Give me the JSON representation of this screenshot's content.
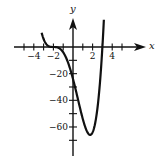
{
  "chart_data": {
    "type": "line",
    "title": "",
    "xlabel": "x",
    "ylabel": "y",
    "function_estimate": "y = (x + 2)^3 (x - 3)",
    "xlim": [
      -5.5,
      5.5
    ],
    "ylim": [
      -78,
      30
    ],
    "x_ticks": [
      -5,
      -4,
      -3,
      -2,
      -1,
      1,
      2,
      3,
      4,
      5
    ],
    "x_tick_labels": [
      "-4",
      "-2",
      "2",
      "4"
    ],
    "x_tick_label_values": [
      -4,
      -2,
      2,
      4
    ],
    "y_ticks": [
      -10,
      -20,
      -30,
      -40,
      -50,
      -60,
      -70
    ],
    "y_tick_labels": [
      "-20",
      "-40",
      "-60"
    ],
    "y_tick_label_values": [
      -20,
      -40,
      -60
    ],
    "grid": false,
    "legend": null,
    "series": [
      {
        "name": "f(x)",
        "x": [
          -3.2,
          -3.0,
          -2.5,
          -2.0,
          -1.5,
          -1.0,
          -0.5,
          0.0,
          0.5,
          1.0,
          1.5,
          1.75,
          2.0,
          2.5,
          3.0,
          3.15
        ],
        "y": [
          10.7,
          6.0,
          0.7,
          0.0,
          -0.6,
          -4.0,
          -12.2,
          -24.0,
          -39.1,
          -54.0,
          -64.3,
          -65.9,
          -64.0,
          -45.6,
          0.0,
          20.5
        ]
      }
    ],
    "key_points": {
      "x_intercepts": [
        -2,
        3
      ],
      "y_intercept": -24,
      "local_minimum": {
        "x": 1.75,
        "y": -65.9
      }
    }
  },
  "labels": {
    "x_axis": "x",
    "y_axis": "y"
  }
}
